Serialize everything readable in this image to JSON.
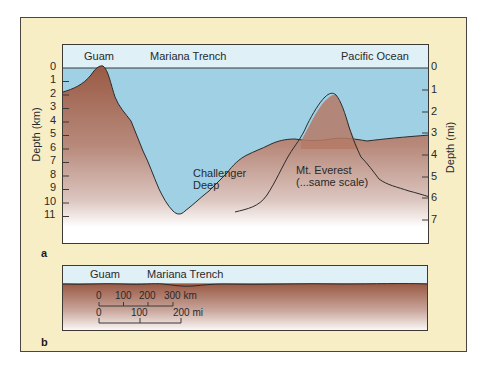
{
  "panel_a": {
    "sublabel": "a",
    "top_labels": {
      "guam": "Guam",
      "trench": "Mariana Trench",
      "ocean": "Pacific Ocean"
    },
    "left_axis": {
      "title": "Depth (km)",
      "ticks": [
        "0",
        "1",
        "2",
        "3",
        "4",
        "5",
        "6",
        "7",
        "8",
        "9",
        "10",
        "11"
      ]
    },
    "right_axis": {
      "title": "Depth (mi)",
      "ticks": [
        "0",
        "1",
        "2",
        "3",
        "4",
        "5",
        "6",
        "7"
      ]
    },
    "annotations": {
      "challenger_line1": "Challenger",
      "challenger_line2": "Deep",
      "everest_line1": "Mt. Everest",
      "everest_line2": "(...same scale)"
    }
  },
  "panel_b": {
    "sublabel": "b",
    "top_labels": {
      "guam": "Guam",
      "trench": "Mariana Trench"
    },
    "scale_km": {
      "ticks": [
        "0",
        "100",
        "200",
        "300 km"
      ]
    },
    "scale_mi": {
      "ticks": [
        "0",
        "100",
        "200 mi"
      ]
    }
  },
  "colors": {
    "frame_bg": "#f8eec6",
    "sky": "#dff0f7",
    "water": "#9fd0e3",
    "rock_top": "#a0604a",
    "rock_mid": "#c4a096",
    "rock_bottom": "#ffffff",
    "outline": "#2b2b2b"
  }
}
